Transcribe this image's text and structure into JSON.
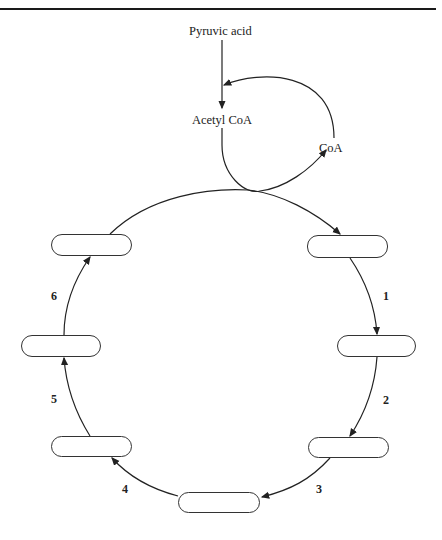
{
  "diagram": {
    "inputs": {
      "pyruvic_acid": "Pyruvic acid",
      "acetyl_coa": "Acetyl CoA",
      "coa": "CoA"
    },
    "steps": [
      {
        "number": "1"
      },
      {
        "number": "2"
      },
      {
        "number": "3"
      },
      {
        "number": "4"
      },
      {
        "number": "5"
      },
      {
        "number": "6"
      }
    ],
    "boxes": [
      {
        "id": "top-right",
        "label": ""
      },
      {
        "id": "right",
        "label": ""
      },
      {
        "id": "bottom-right",
        "label": ""
      },
      {
        "id": "bottom",
        "label": ""
      },
      {
        "id": "bottom-left",
        "label": ""
      },
      {
        "id": "left",
        "label": ""
      },
      {
        "id": "top-left",
        "label": ""
      }
    ]
  }
}
